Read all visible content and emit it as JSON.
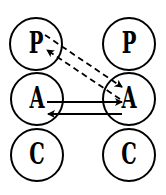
{
  "diagram": {
    "type": "transactional-analysis-ego-state-diagram",
    "stroke_color": "#000000",
    "background_color": "#ffffff",
    "persons": [
      {
        "id": "left",
        "states": [
          {
            "id": "left-parent",
            "label": "P",
            "cx": 36,
            "cy": 44,
            "r": 26
          },
          {
            "id": "left-adult",
            "label": "A",
            "cx": 37,
            "cy": 99,
            "r": 26
          },
          {
            "id": "left-child",
            "label": "C",
            "cx": 37,
            "cy": 155,
            "r": 26
          }
        ]
      },
      {
        "id": "right",
        "states": [
          {
            "id": "right-parent",
            "label": "P",
            "cx": 129,
            "cy": 44,
            "r": 26
          },
          {
            "id": "right-adult",
            "label": "A",
            "cx": 129,
            "cy": 99,
            "r": 26
          },
          {
            "id": "right-child",
            "label": "C",
            "cx": 129,
            "cy": 155,
            "r": 26
          }
        ]
      }
    ],
    "transactions": [
      {
        "from": "left-parent",
        "to": "right-adult",
        "style": "dashed",
        "x1": 45,
        "y1": 35,
        "x2": 122,
        "y2": 87
      },
      {
        "from": "right-adult",
        "to": "left-parent",
        "style": "dashed",
        "x1": 120,
        "y1": 99,
        "x2": 47,
        "y2": 50
      },
      {
        "from": "left-adult",
        "to": "right-adult",
        "style": "solid",
        "x1": 47,
        "y1": 102,
        "x2": 122,
        "y2": 102
      },
      {
        "from": "right-adult",
        "to": "left-adult",
        "style": "solid",
        "x1": 122,
        "y1": 114,
        "x2": 48,
        "y2": 114
      }
    ]
  }
}
